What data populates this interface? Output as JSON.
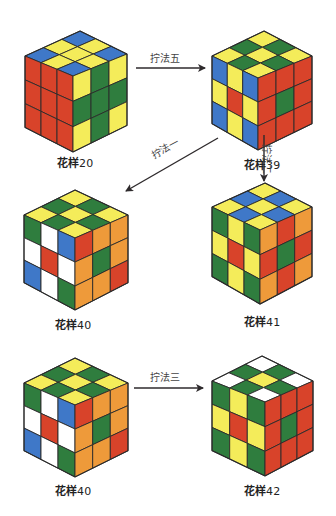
{
  "palette": {
    "R": "#d8432a",
    "O": "#ee9a3a",
    "Y": "#f4ec5a",
    "G": "#2f7d3e",
    "B": "#3f78c8",
    "W": "#ffffff",
    "edge": "#2a2a2a"
  },
  "arrow_color": "#2e2a2c",
  "cubes": [
    {
      "id": "pattern-20",
      "label": "花样",
      "number": "20",
      "geom": {
        "top": [
          80,
          31
        ],
        "left": [
          25,
          56
        ],
        "front": [
          73,
          76
        ],
        "right": [
          127,
          54
        ],
        "height": 76
      },
      "caption_pos": [
        75,
        161
      ],
      "top_face": [
        [
          "B",
          "Y",
          "B"
        ],
        [
          "Y",
          "Y",
          "Y"
        ],
        [
          "B",
          "Y",
          "B"
        ]
      ],
      "left_face": [
        [
          "R",
          "R",
          "R"
        ],
        [
          "R",
          "R",
          "R"
        ],
        [
          "R",
          "R",
          "R"
        ]
      ],
      "right_face": [
        [
          "Y",
          "G",
          "Y"
        ],
        [
          "G",
          "G",
          "G"
        ],
        [
          "Y",
          "G",
          "Y"
        ]
      ]
    },
    {
      "id": "pattern-39",
      "label": "花样",
      "number": "39",
      "geom": {
        "top": [
          264,
          31
        ],
        "left": [
          212,
          56
        ],
        "front": [
          258,
          78
        ],
        "right": [
          312,
          56
        ],
        "height": 72
      },
      "caption_pos": [
        262,
        163
      ],
      "top_face": [
        [
          "Y",
          "G",
          "Y"
        ],
        [
          "G",
          "Y",
          "G"
        ],
        [
          "Y",
          "G",
          "Y"
        ]
      ],
      "left_face": [
        [
          "B",
          "Y",
          "B"
        ],
        [
          "Y",
          "R",
          "Y"
        ],
        [
          "B",
          "Y",
          "B"
        ]
      ],
      "right_face": [
        [
          "R",
          "R",
          "R"
        ],
        [
          "R",
          "G",
          "R"
        ],
        [
          "R",
          "R",
          "R"
        ]
      ]
    },
    {
      "id": "pattern-40-a",
      "label": "花样",
      "number": "40",
      "geom": {
        "top": [
          75,
          190
        ],
        "left": [
          24,
          215
        ],
        "front": [
          75,
          238
        ],
        "right": [
          128,
          215
        ],
        "height": 72
      },
      "caption_pos": [
        73,
        323
      ],
      "top_face": [
        [
          "Y",
          "G",
          "Y"
        ],
        [
          "G",
          "Y",
          "G"
        ],
        [
          "Y",
          "G",
          "Y"
        ]
      ],
      "left_face": [
        [
          "G",
          "W",
          "B"
        ],
        [
          "W",
          "R",
          "W"
        ],
        [
          "B",
          "W",
          "G"
        ]
      ],
      "right_face": [
        [
          "R",
          "O",
          "O"
        ],
        [
          "O",
          "G",
          "O"
        ],
        [
          "O",
          "O",
          "R"
        ]
      ]
    },
    {
      "id": "pattern-41",
      "label": "花样",
      "number": "41",
      "geom": {
        "top": [
          265,
          183
        ],
        "left": [
          212,
          207
        ],
        "front": [
          260,
          230
        ],
        "right": [
          312,
          207
        ],
        "height": 74
      },
      "caption_pos": [
        262,
        320
      ],
      "top_face": [
        [
          "Y",
          "B",
          "Y"
        ],
        [
          "B",
          "Y",
          "B"
        ],
        [
          "Y",
          "B",
          "Y"
        ]
      ],
      "left_face": [
        [
          "G",
          "Y",
          "G"
        ],
        [
          "Y",
          "R",
          "Y"
        ],
        [
          "G",
          "Y",
          "G"
        ]
      ],
      "right_face": [
        [
          "O",
          "R",
          "O"
        ],
        [
          "R",
          "G",
          "R"
        ],
        [
          "O",
          "R",
          "O"
        ]
      ]
    },
    {
      "id": "pattern-40-b",
      "label": "花样",
      "number": "40",
      "geom": {
        "top": [
          75,
          358
        ],
        "left": [
          24,
          383
        ],
        "front": [
          75,
          405
        ],
        "right": [
          128,
          383
        ],
        "height": 72
      },
      "caption_pos": [
        73,
        489
      ],
      "top_face": [
        [
          "Y",
          "G",
          "Y"
        ],
        [
          "G",
          "Y",
          "G"
        ],
        [
          "Y",
          "G",
          "Y"
        ]
      ],
      "left_face": [
        [
          "G",
          "W",
          "B"
        ],
        [
          "W",
          "R",
          "W"
        ],
        [
          "B",
          "W",
          "G"
        ]
      ],
      "right_face": [
        [
          "R",
          "O",
          "O"
        ],
        [
          "O",
          "G",
          "O"
        ],
        [
          "O",
          "O",
          "R"
        ]
      ]
    },
    {
      "id": "pattern-42",
      "label": "花样",
      "number": "42",
      "geom": {
        "top": [
          262,
          356
        ],
        "left": [
          212,
          381
        ],
        "front": [
          265,
          402
        ],
        "right": [
          313,
          381
        ],
        "height": 74
      },
      "caption_pos": [
        262,
        489
      ],
      "top_face": [
        [
          "W",
          "G",
          "W"
        ],
        [
          "G",
          "Y",
          "G"
        ],
        [
          "W",
          "G",
          "W"
        ]
      ],
      "left_face": [
        [
          "G",
          "Y",
          "G"
        ],
        [
          "Y",
          "R",
          "Y"
        ],
        [
          "G",
          "Y",
          "G"
        ]
      ],
      "right_face": [
        [
          "R",
          "R",
          "R"
        ],
        [
          "R",
          "G",
          "R"
        ],
        [
          "R",
          "R",
          "R"
        ]
      ]
    }
  ],
  "moves": [
    {
      "id": "move-5",
      "label": "拧法五",
      "from": [
        136,
        68
      ],
      "to": [
        205,
        68
      ],
      "label_pos": [
        150,
        50
      ],
      "rotate": 0
    },
    {
      "id": "move-1",
      "label": "拧法一",
      "from": [
        218,
        138
      ],
      "to": [
        126,
        191
      ],
      "label_pos": [
        148,
        148
      ],
      "rotate": -28
    },
    {
      "id": "move-2",
      "label": "拧法二",
      "from": [
        264,
        135
      ],
      "to": [
        264,
        181
      ],
      "label_pos": [
        275,
        144
      ],
      "rotate": 90
    },
    {
      "id": "move-3",
      "label": "拧法三",
      "from": [
        134,
        388
      ],
      "to": [
        203,
        388
      ],
      "label_pos": [
        150,
        369
      ],
      "rotate": 0
    }
  ]
}
